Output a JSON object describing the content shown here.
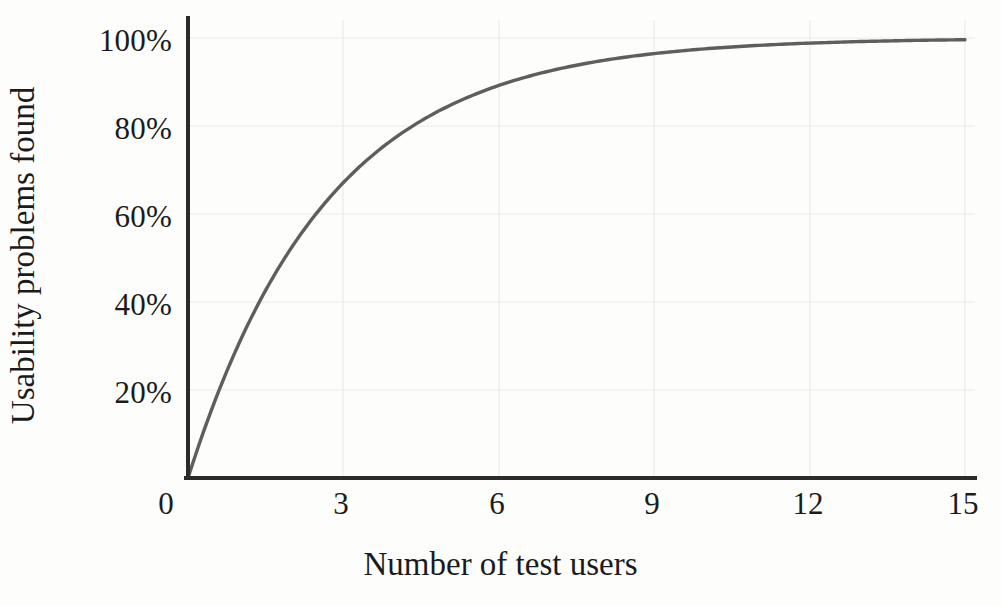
{
  "chart_data": {
    "type": "line",
    "title": "",
    "xlabel": "Number of test users",
    "ylabel": "Usability problems found",
    "xlim": [
      0,
      15
    ],
    "ylim": [
      0,
      105
    ],
    "xticks": [
      0,
      3,
      6,
      9,
      12,
      15
    ],
    "xticklabels": [
      "0",
      "3",
      "6",
      "9",
      "12",
      "15"
    ],
    "yticks": [
      20,
      40,
      60,
      80,
      100
    ],
    "yticklabels": [
      "20%",
      "40%",
      "60%",
      "80%",
      "100%"
    ],
    "grid": "both-axes-faint",
    "legend": "none",
    "series": [
      {
        "name": "Usability problems found",
        "formula": "100 * (1 - (1 - 0.31)^n)",
        "x": [
          0,
          0.25,
          0.5,
          0.75,
          1,
          1.5,
          2,
          2.5,
          3,
          3.5,
          4,
          4.5,
          5,
          5.5,
          6,
          6.5,
          7,
          7.5,
          8,
          8.5,
          9,
          9.5,
          10,
          10.5,
          11,
          11.5,
          12,
          12.5,
          13,
          13.5,
          14,
          14.5,
          15
        ],
        "y": [
          0,
          8.9,
          17.0,
          24.4,
          31.0,
          42.6,
          52.4,
          60.6,
          67.2,
          72.9,
          77.4,
          81.2,
          84.4,
          87.0,
          89.2,
          91.0,
          92.6,
          93.9,
          94.9,
          95.8,
          96.5,
          97.2,
          97.6,
          98.1,
          98.4,
          98.7,
          99.0,
          99.2,
          99.3,
          99.5,
          99.6,
          99.7,
          99.8
        ]
      }
    ],
    "colors": {
      "curve": "#5e5e5e",
      "axis": "#2b2b2b",
      "grid": "#e9e9ea",
      "background": "#fdfdfb",
      "text": "#1b1b1b"
    }
  },
  "axis_titles": {
    "x": "Number of test users",
    "y": "Usability problems found"
  }
}
